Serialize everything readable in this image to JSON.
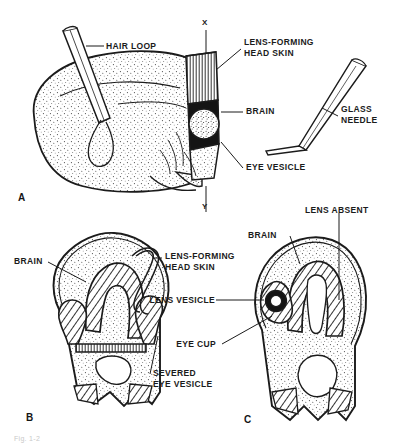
{
  "figure": {
    "caption": "Fig. 1-2",
    "panel_letters": [
      "A",
      "B",
      "C"
    ],
    "axis_markers": {
      "top": "X",
      "bottom": "Y"
    },
    "ink_color": "#1b1b1b",
    "paper_color": "#ffffff",
    "stipple_color": "#3a3a3a"
  },
  "panel_a": {
    "letter": "A",
    "marker_top": "X",
    "marker_bottom": "Y",
    "labels": {
      "hair_loop": "HAIR LOOP",
      "lens_forming_head_skin": "LENS-FORMING\nHEAD SKIN",
      "brain": "BRAIN",
      "eye_vesicle": "EYE VESICLE",
      "glass_needle": "GLASS\nNEEDLE"
    }
  },
  "panel_b": {
    "letter": "B",
    "labels": {
      "brain": "BRAIN",
      "lens_forming_head_skin": "LENS-FORMING\nHEAD SKIN",
      "severed_eye_vesicle": "SEVERED\nEYE VESICLE"
    }
  },
  "panel_c": {
    "letter": "C",
    "labels": {
      "brain": "BRAIN",
      "lens_absent": "LENS ABSENT",
      "lens_vesicle": "LENS VESICLE",
      "eye_cup": "EYE CUP"
    }
  }
}
